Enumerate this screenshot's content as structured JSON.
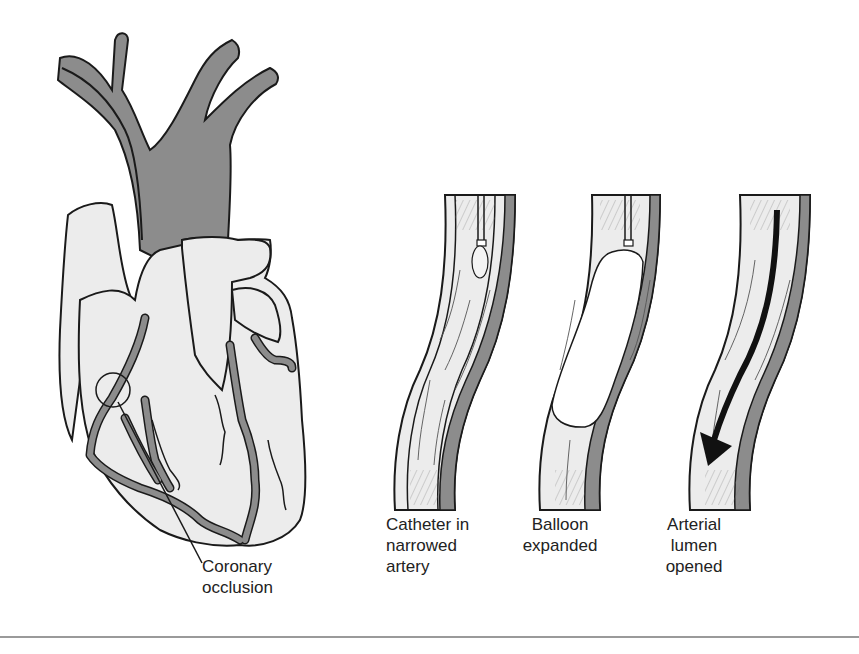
{
  "figure": {
    "colors": {
      "vessel_dark": "#8c8c8c",
      "heart_fill": "#ececec",
      "outline": "#1a1a1a",
      "balloon": "#ffffff",
      "rule": "#9a9a9a"
    },
    "heart": {
      "callout_label": "Coronary\nocclusion",
      "callout_line1": "Coronary",
      "callout_line2": "occlusion"
    },
    "panels": [
      {
        "id": "catheter",
        "line1": "Catheter in",
        "line2": "narrowed",
        "line3": "artery"
      },
      {
        "id": "balloon",
        "line1": "Balloon",
        "line2": "expanded"
      },
      {
        "id": "opened",
        "line1": "Arterial",
        "line2": "lumen",
        "line3": "opened"
      }
    ]
  }
}
